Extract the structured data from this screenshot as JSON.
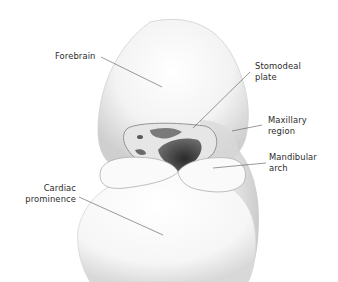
{
  "figure": {
    "labels": [
      {
        "id": "forebrain",
        "lines": [
          "Forebrain"
        ]
      },
      {
        "id": "stomodeal-plate",
        "lines": [
          "Stomodeal",
          "plate"
        ]
      },
      {
        "id": "maxillary-region",
        "lines": [
          "Maxillary",
          "region"
        ]
      },
      {
        "id": "mandibular-arch",
        "lines": [
          "Mandibular",
          "arch"
        ]
      },
      {
        "id": "cardiac-prominence",
        "lines": [
          "Cardiac",
          "prominence"
        ]
      }
    ],
    "colors": {
      "background": "#ffffff",
      "tissue_light": "#f4f4f4",
      "tissue_shade": "#b8b8b8",
      "tissue_dark": "#3a3a3a",
      "leader_line": "#555555",
      "text": "#2b2b2b"
    }
  }
}
